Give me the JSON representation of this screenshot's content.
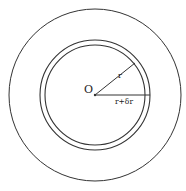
{
  "diagram": {
    "center_label": "O",
    "inner_radius_label": "r",
    "outer_radius_label": "r+δr",
    "stroke_color": "#333333",
    "background": "#ffffff",
    "circles": [
      {
        "name": "outer-circle",
        "cx": 95,
        "cy": 95,
        "r": 86
      },
      {
        "name": "shell-outer-circle",
        "cx": 95,
        "cy": 95,
        "r": 55
      },
      {
        "name": "shell-inner-circle",
        "cx": 95,
        "cy": 95,
        "r": 50
      }
    ]
  }
}
